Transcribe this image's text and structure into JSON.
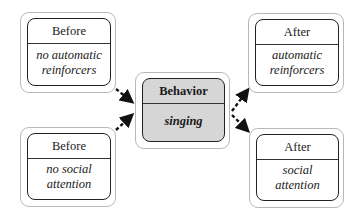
{
  "diagram": {
    "antecedent_1": {
      "header": "Before",
      "content": "no automatic\nreinforcers"
    },
    "antecedent_2": {
      "header": "Before",
      "content": "no social\nattention"
    },
    "behavior": {
      "header": "Behavior",
      "content": "singing"
    },
    "consequence_1": {
      "header": "After",
      "content": "automatic\nreinforcers"
    },
    "consequence_2": {
      "header": "After",
      "content": "social\nattention"
    },
    "colors": {
      "behavior_fill": "#d6d6d6",
      "line": "#222222",
      "outer_border": "#b8b8b8"
    }
  }
}
